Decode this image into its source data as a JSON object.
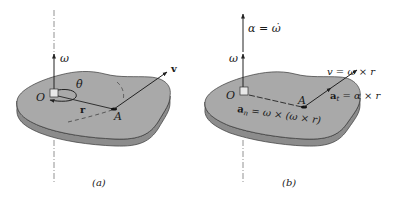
{
  "figure": {
    "colors": {
      "plate_top": "#a9a9a9",
      "plate_side": "#8c8c8c",
      "plate_edge": "#3a3a3a",
      "line": "#222222",
      "axis": "#777777",
      "background": "#ffffff"
    },
    "panel_a": {
      "caption": "(a)",
      "labels": {
        "omega": "ω",
        "theta_dot": "θ̇",
        "origin": "O",
        "point": "A",
        "radius": "r",
        "velocity": "v"
      }
    },
    "panel_b": {
      "caption": "(b)",
      "labels": {
        "alpha": "α = ω̇",
        "omega": "ω",
        "origin": "O",
        "point": "A",
        "velocity": "v = ω × r",
        "tangential_accel": "a",
        "tangential_sub": "t",
        "tangential_rhs": " = α × r",
        "normal_accel": "a",
        "normal_sub": "n",
        "normal_rhs": " = ω × (ω × r)"
      }
    }
  }
}
